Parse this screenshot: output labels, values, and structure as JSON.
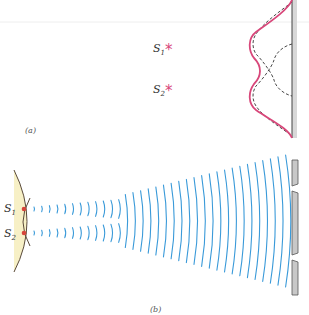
{
  "panel_a": {
    "label": "(a)",
    "sources": [
      {
        "name": "S",
        "sub": "1",
        "marker": "*"
      },
      {
        "name": "S",
        "sub": "2",
        "marker": "*"
      }
    ],
    "curves": {
      "combined": "combined intensity pattern",
      "individual": "individual source intensity patterns"
    }
  },
  "panel_b": {
    "label": "(b)",
    "sources": [
      {
        "name": "S",
        "sub": "1"
      },
      {
        "name": "S",
        "sub": "2"
      }
    ],
    "screen_slits": 2
  },
  "colors": {
    "source_marker": "#d8477a",
    "combined_curve": "#d8477a",
    "wavefront": "#3a9ad9",
    "lens_fill": "#f7f0c6",
    "lens_stroke": "#5a4a3a",
    "source_dot": "#d6453a",
    "screen_fill": "#c8c8c8",
    "screen_stroke": "#555555"
  }
}
